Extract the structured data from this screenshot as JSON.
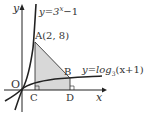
{
  "diagram": {
    "axes": {
      "x_label": "x",
      "y_label": "y",
      "origin_label": "O"
    },
    "curve1": {
      "label": "y=3ˣ−1",
      "label_parts": [
        "y=3",
        "x",
        "−1"
      ]
    },
    "curve2": {
      "label": "y=log₃(x+1)",
      "label_parts": [
        "y=log",
        "3",
        "(x+1)"
      ]
    },
    "points": {
      "A": {
        "label": "A(2, 8)"
      },
      "B": {
        "label": "B"
      },
      "C": {
        "label": "C"
      },
      "D": {
        "label": "D"
      }
    },
    "colors": {
      "shade": "#d8d8d8",
      "stroke": "#222222"
    }
  }
}
